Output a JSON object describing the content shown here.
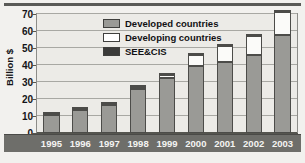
{
  "figure": {
    "y_axis_title": "Billion $"
  },
  "legend": {
    "position": "top-center",
    "items": [
      {
        "label": "Developed countries",
        "swatch": "developed",
        "color": "#9a9a96"
      },
      {
        "label": "Developing countries",
        "swatch": "developing",
        "color": "#ffffff"
      },
      {
        "label": "SEE&CIS",
        "swatch": "see",
        "color": "#3b3b3a"
      }
    ]
  },
  "chart_data": {
    "type": "bar",
    "title": "",
    "xlabel": "",
    "ylabel": "Billion $",
    "ylim": [
      0,
      70
    ],
    "yticks": [
      0,
      10,
      20,
      30,
      40,
      50,
      60,
      70
    ],
    "ytick_labels": [
      "0",
      "10",
      "20",
      "30",
      "40",
      "50",
      "60",
      "70"
    ],
    "grid": "horizontal",
    "stacked": true,
    "legend_position": "top-center",
    "categories": [
      "1995",
      "1996",
      "1997",
      "1998",
      "1999",
      "2000",
      "2001",
      "2002",
      "2003"
    ],
    "series": [
      {
        "name": "Developed countries",
        "color": "#9a9a96",
        "values": [
          10.8,
          13.6,
          16.3,
          26.0,
          32.5,
          39.5,
          41.8,
          45.7,
          57.5
        ]
      },
      {
        "name": "Developing countries",
        "color": "#ffffff",
        "values": [
          0.4,
          0.4,
          0.7,
          0.9,
          1.5,
          6.2,
          9.3,
          11.2,
          13.5
        ]
      },
      {
        "name": "SEE&CIS",
        "color": "#3b3b3a",
        "values": [
          0.1,
          0.1,
          0.1,
          0.1,
          0.1,
          0.2,
          0.2,
          0.2,
          0.3
        ]
      }
    ],
    "totals": [
      11.3,
      14.1,
      17.1,
      27.0,
      34.1,
      45.9,
      51.3,
      57.1,
      71.3
    ]
  }
}
